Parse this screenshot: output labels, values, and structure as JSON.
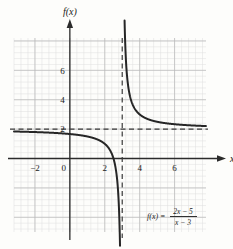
{
  "chart_data": {
    "type": "line",
    "title": "",
    "function_label": "f(x) =",
    "function_numerator": "2x − 5",
    "function_denominator": "x − 3",
    "function_full": "f(x) = (2x − 5)/(x − 3)",
    "ylabel": "f(x)",
    "xlabel": "x",
    "xlim": [
      -3.2,
      7.8
    ],
    "ylim": [
      -5.0,
      8.2
    ],
    "xticks": [
      -2,
      0,
      2,
      4,
      6
    ],
    "xtick_labels": [
      "−2",
      "0",
      "2",
      "4",
      "6"
    ],
    "yticks": [
      2,
      4,
      6
    ],
    "ytick_labels": [
      "2",
      "4",
      "6"
    ],
    "grid": true,
    "grid_major_step": 2,
    "grid_minor_step": 0.4,
    "legend": "none",
    "asymptotes": [
      {
        "name": "vertical-asymptote",
        "type": "vertical",
        "value": 3,
        "style": "dashed"
      },
      {
        "name": "horizontal-asymptote",
        "type": "horizontal",
        "value": 2,
        "style": "dashed"
      }
    ],
    "x_intercept": 2.5,
    "y_intercept": 1.6667,
    "branches": [
      {
        "name": "left-branch",
        "domain": [
          -3.2,
          2.97
        ]
      },
      {
        "name": "right-branch",
        "domain": [
          3.04,
          7.8
        ]
      }
    ],
    "curve_color": "#262626",
    "asymptote_color": "#3a3a3a",
    "axis_color": "#2b2b2b",
    "grid_major_color": "#b9b9b9",
    "grid_minor_color": "#dedede",
    "background_color": "#fdfdfb"
  }
}
